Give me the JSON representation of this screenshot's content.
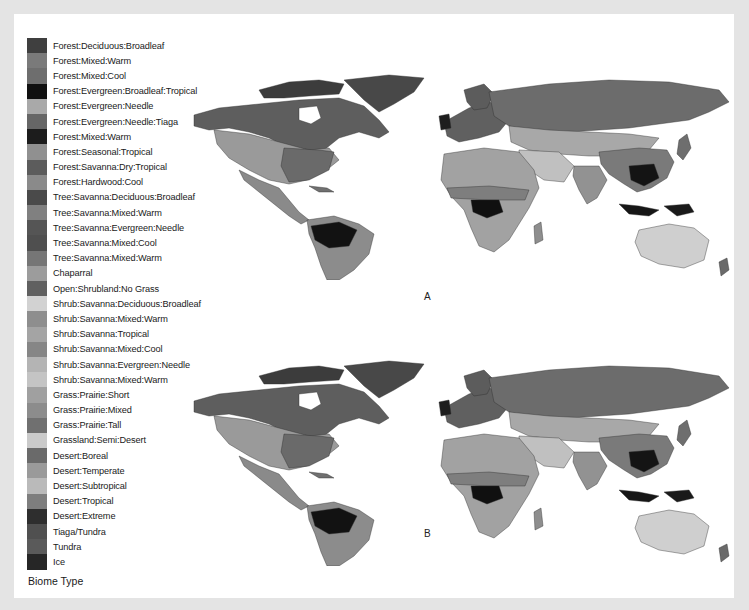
{
  "figure": {
    "legend": {
      "title": "Biome Type",
      "items": [
        {
          "label": "Forest:Deciduous:Broadleaf",
          "color": "#3f3f3f"
        },
        {
          "label": "Forest:Mixed:Warm",
          "color": "#7a7a7a"
        },
        {
          "label": "Forest:Mixed:Cool",
          "color": "#6e6e6e"
        },
        {
          "label": "Forest:Evergreen:Broadleaf:Tropical",
          "color": "#101010"
        },
        {
          "label": "Forest:Evergreen:Needle",
          "color": "#a9a9a9"
        },
        {
          "label": "Forest:Evergreen:Needle:Tiaga",
          "color": "#666666"
        },
        {
          "label": "Forest:Mixed:Warm",
          "color": "#1c1c1c"
        },
        {
          "label": "Forest:Seasonal:Tropical",
          "color": "#909090"
        },
        {
          "label": "Forest:Savanna:Dry:Tropical",
          "color": "#5c5c5c"
        },
        {
          "label": "Forest:Hardwood:Cool",
          "color": "#8a8a8a"
        },
        {
          "label": "Tree:Savanna:Deciduous:Broadleaf",
          "color": "#4a4a4a"
        },
        {
          "label": "Tree:Savanna:Mixed:Warm",
          "color": "#808080"
        },
        {
          "label": "Tree:Savanna:Evergreen:Needle",
          "color": "#555555"
        },
        {
          "label": "Tree:Savanna:Mixed:Cool",
          "color": "#4f4f4f"
        },
        {
          "label": "Tree:Savanna:Mixed:Warm",
          "color": "#767676"
        },
        {
          "label": "Chaparral",
          "color": "#9c9c9c"
        },
        {
          "label": "Open:Shrubland:No Grass",
          "color": "#606060"
        },
        {
          "label": "Shrub:Savanna:Deciduous:Broadleaf",
          "color": "#d2d2d2"
        },
        {
          "label": "Shrub:Savanna:Mixed:Warm",
          "color": "#8e8e8e"
        },
        {
          "label": "Shrub:Savanna:Tropical",
          "color": "#a4a4a4"
        },
        {
          "label": "Shrub:Savanna:Mixed:Cool",
          "color": "#868686"
        },
        {
          "label": "Shrub:Savanna:Evergreen:Needle",
          "color": "#b4b4b4"
        },
        {
          "label": "Shrub:Savanna:Mixed:Warm",
          "color": "#c4c4c4"
        },
        {
          "label": "Grass:Prairie:Short",
          "color": "#a0a0a0"
        },
        {
          "label": "Grass:Prairie:Mixed",
          "color": "#8c8c8c"
        },
        {
          "label": "Grass:Prairie:Tall",
          "color": "#707070"
        },
        {
          "label": "Grassland:Semi:Desert",
          "color": "#cacaca"
        },
        {
          "label": "Desert:Boreal",
          "color": "#6a6a6a"
        },
        {
          "label": "Desert:Temperate",
          "color": "#9a9a9a"
        },
        {
          "label": "Desert:Subtropical",
          "color": "#bababa"
        },
        {
          "label": "Desert:Tropical",
          "color": "#7e7e7e"
        },
        {
          "label": "Desert:Extreme",
          "color": "#2e2e2e"
        },
        {
          "label": "Tiaga/Tundra",
          "color": "#505050"
        },
        {
          "label": "Tundra",
          "color": "#5a5a5a"
        },
        {
          "label": "Ice",
          "color": "#262626"
        }
      ]
    },
    "maps": [
      {
        "id": "A",
        "label": "A"
      },
      {
        "id": "B",
        "label": "B"
      }
    ]
  }
}
